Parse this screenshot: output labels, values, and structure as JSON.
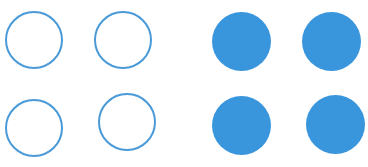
{
  "colors": {
    "background": "#ffffff",
    "outline_stroke": "#4a9ad8",
    "fill": "#3a96dc"
  },
  "groups": [
    {
      "name": "empty-circles",
      "style": "outline",
      "circles": [
        {
          "cx": 34,
          "cy": 40,
          "r": 29
        },
        {
          "cx": 123,
          "cy": 40,
          "r": 29
        },
        {
          "cx": 34,
          "cy": 128,
          "r": 29
        },
        {
          "cx": 127,
          "cy": 122,
          "r": 29
        }
      ]
    },
    {
      "name": "filled-circles",
      "style": "filled",
      "circles": [
        {
          "cx": 241,
          "cy": 41,
          "r": 29.5
        },
        {
          "cx": 331,
          "cy": 41,
          "r": 29.5
        },
        {
          "cx": 241,
          "cy": 125,
          "r": 29.5
        },
        {
          "cx": 335,
          "cy": 124,
          "r": 29.5
        }
      ]
    }
  ]
}
